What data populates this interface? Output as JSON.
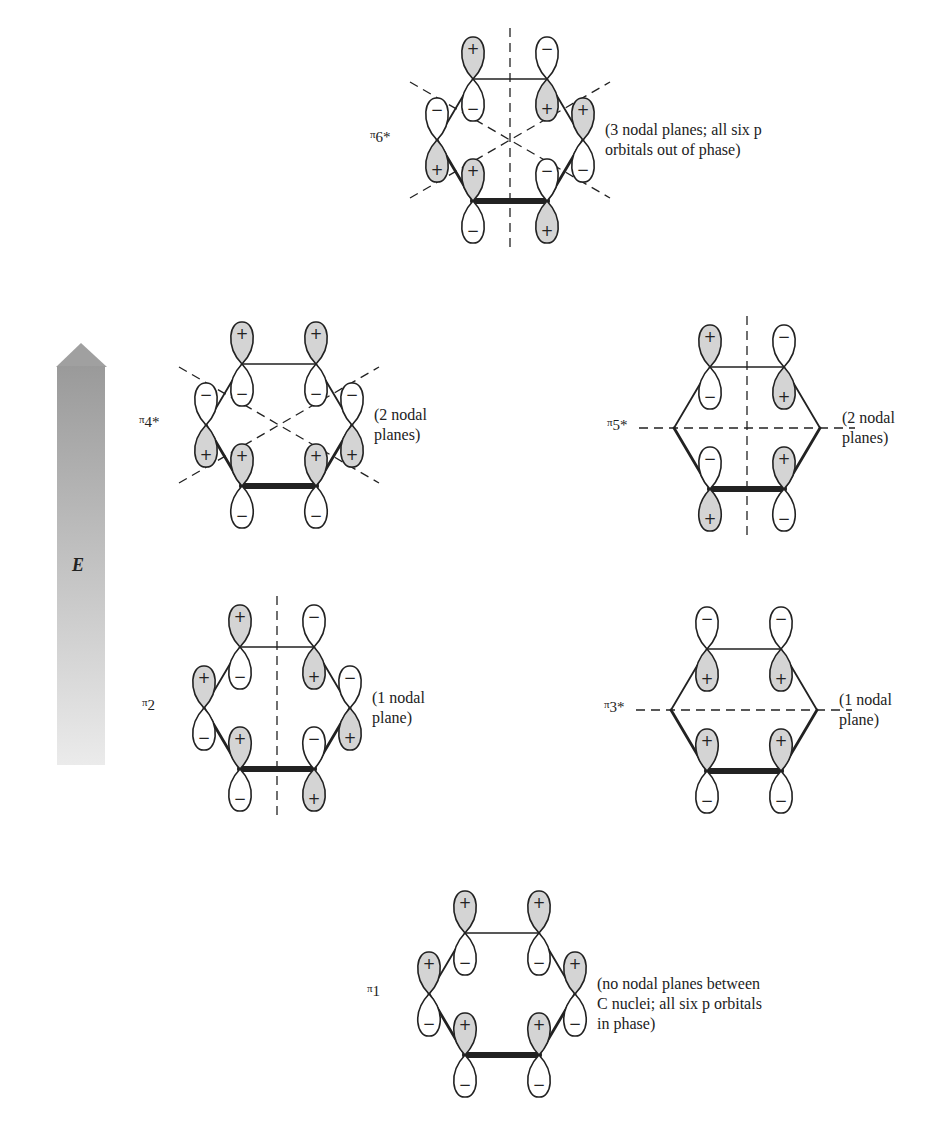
{
  "figure": {
    "energy_axis": {
      "label": "E",
      "direction": "up",
      "color_top": "#9a9a9a",
      "color_bottom": "#e6e6e6"
    },
    "colors": {
      "positive_lobe": "#d4d4d4",
      "negative_lobe": "#ffffff",
      "stroke": "#222222"
    }
  },
  "orbitals": [
    {
      "id": "pi6",
      "name": "π6*",
      "name_prefix": "π",
      "name_suffix": "6*",
      "description_lines": [
        "(3 nodal planes; all six p",
        "orbitals out of phase)"
      ],
      "center": [
        510,
        140
      ],
      "atoms_top_sign": [
        "+",
        "−",
        "−",
        "+",
        "+",
        "−"
      ],
      "nodal_planes": [
        "vertical",
        "diag-a",
        "diag-b"
      ]
    },
    {
      "id": "pi4",
      "name": "π4*",
      "name_prefix": "π",
      "name_suffix": "4*",
      "description_lines": [
        "(2 nodal",
        "planes)"
      ],
      "center": [
        279,
        425
      ],
      "atoms_top_sign": [
        "+",
        "+",
        "−",
        "−",
        "+",
        "+"
      ],
      "nodal_planes": [
        "diag-a",
        "diag-b"
      ]
    },
    {
      "id": "pi5",
      "name": "π5*",
      "name_prefix": "π",
      "name_suffix": "5*",
      "description_lines": [
        "(2 nodal",
        "planes)"
      ],
      "center": [
        747,
        428
      ],
      "atoms_top_sign": [
        "+",
        "−",
        null,
        null,
        "−",
        "+"
      ],
      "nodal_planes": [
        "vertical",
        "horizontal"
      ]
    },
    {
      "id": "pi2",
      "name": "π2",
      "name_prefix": "π",
      "name_suffix": "2",
      "description_lines": [
        "(1 nodal",
        "plane)"
      ],
      "center": [
        277,
        708
      ],
      "atoms_top_sign": [
        "+",
        "−",
        "+",
        "−",
        "+",
        "−"
      ],
      "nodal_planes": [
        "vertical"
      ]
    },
    {
      "id": "pi3",
      "name": "π3*",
      "name_prefix": "π",
      "name_suffix": "3*",
      "description_lines": [
        "(1 nodal",
        "plane)"
      ],
      "center": [
        744,
        710
      ],
      "atoms_top_sign": [
        "−",
        "−",
        null,
        null,
        "+",
        "+"
      ],
      "nodal_planes": [
        "horizontal"
      ]
    },
    {
      "id": "pi1",
      "name": "π1",
      "name_prefix": "π",
      "name_suffix": "1",
      "description_lines": [
        "(no nodal planes between",
        "C nuclei; all six p orbitals",
        "in phase)"
      ],
      "center": [
        502,
        994
      ],
      "atoms_top_sign": [
        "+",
        "+",
        "+",
        "+",
        "+",
        "+"
      ],
      "nodal_planes": []
    }
  ]
}
